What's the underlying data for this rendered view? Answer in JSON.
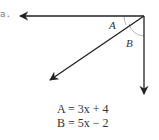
{
  "problem": {
    "label": "a."
  },
  "diagram": {
    "angles": [
      {
        "name": "A",
        "label": "A"
      },
      {
        "name": "B",
        "label": "B"
      }
    ],
    "stroke_color": "#222222",
    "arc_color": "#999999"
  },
  "equations": [
    {
      "lhs": "A",
      "text": "A = 3x + 4"
    },
    {
      "lhs": "B",
      "text": "B = 5x − 2"
    }
  ]
}
